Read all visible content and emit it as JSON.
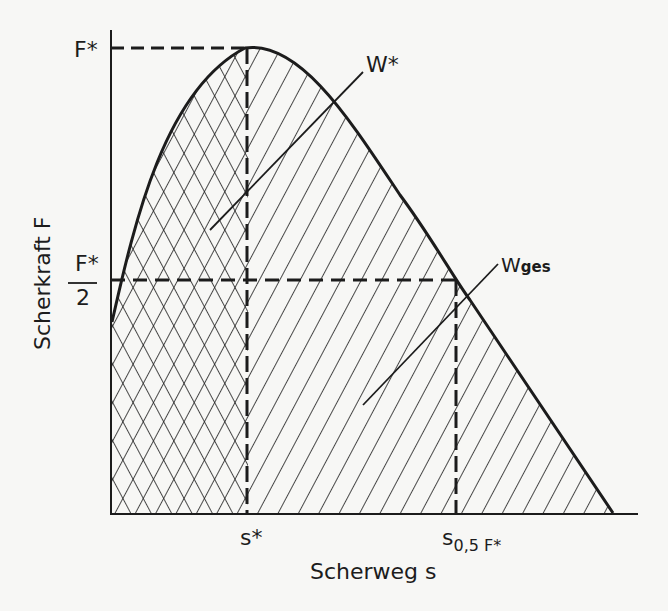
{
  "figure": {
    "type": "shear force vs. shear displacement diagram",
    "y_axis_label": "Scherkraft F",
    "x_axis_label": "Scherweg s",
    "y_ticks": {
      "peak": "F*",
      "half_peak_num": "F*",
      "half_peak_den": "2"
    },
    "x_ticks": {
      "peak_disp": "s*",
      "half_disp_main": "s",
      "half_disp_sub": "0,5 F*"
    },
    "annotations": {
      "w_star": "W*",
      "w_ges_main": "W",
      "w_ges_sub": "ges"
    },
    "regions": [
      {
        "name": "W*",
        "description": "work up to maximum force (cross-hatched), area under curve from 0 to s*"
      },
      {
        "name": "Wges",
        "description": "total work (single hatched + cross-hatched), area under curve from 0 to end"
      }
    ],
    "colors": {
      "ink": "#1c1c1c",
      "paper": "#f7f7f5"
    }
  }
}
